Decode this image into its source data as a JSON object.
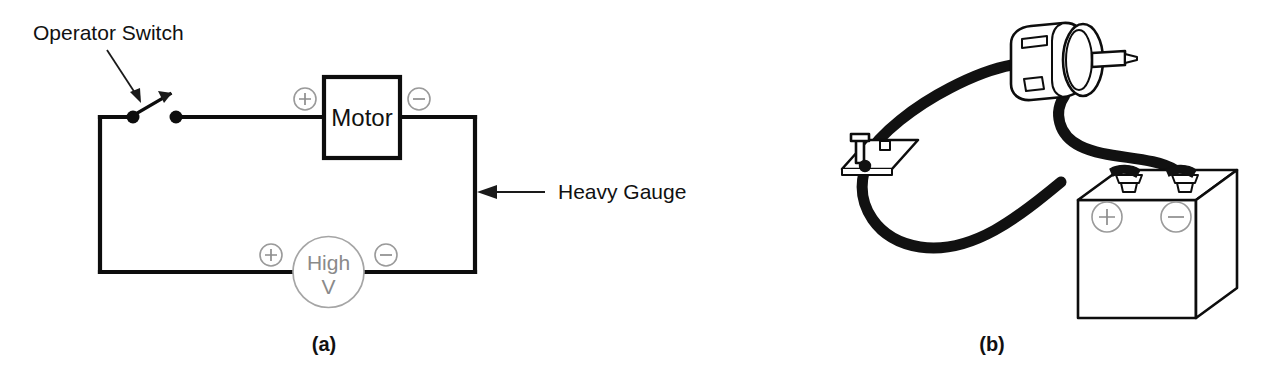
{
  "figure": {
    "background_color": "#ffffff",
    "line_color": "#0d0d0d",
    "accent_gray": "#9a9a9a",
    "panels": [
      {
        "caption": "(a)",
        "kind": "schematic"
      },
      {
        "caption": "(b)",
        "kind": "pictorial"
      }
    ]
  },
  "panel_a": {
    "caption": "(a)",
    "labels": {
      "switch": "Operator Switch",
      "gauge": "Heavy Gauge"
    },
    "motor": {
      "name": "Motor",
      "terminal_left": "+",
      "terminal_right": "−"
    },
    "source": {
      "line1": "High",
      "line2": "V",
      "terminal_left": "+",
      "terminal_right": "−"
    }
  },
  "panel_b": {
    "caption": "(b)",
    "battery": {
      "terminal_left": "+",
      "terminal_right": "−"
    },
    "components": [
      {
        "name": "dc-motor"
      },
      {
        "name": "knife-switch"
      },
      {
        "name": "battery"
      },
      {
        "name": "cable-switch-to-motor"
      },
      {
        "name": "cable-motor-to-battery"
      },
      {
        "name": "cable-switch-to-battery"
      }
    ]
  }
}
